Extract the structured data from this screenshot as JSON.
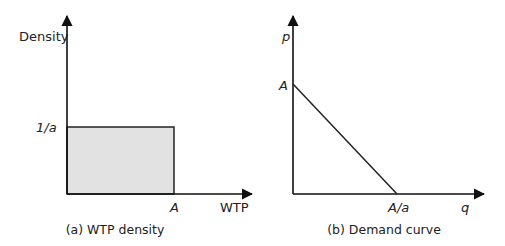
{
  "panels": [
    {
      "id": "a",
      "caption": "(a) WTP density",
      "y_axis_label": "Density",
      "x_axis_label": "WTP",
      "y_tick_label": "1/a",
      "x_tick_label": "A",
      "fill_color": "#e2e2e2"
    },
    {
      "id": "b",
      "caption": "(b) Demand curve",
      "y_axis_label": "p",
      "x_axis_label": "q",
      "y_tick_label": "A",
      "x_tick_label": "A/a"
    }
  ],
  "colors": {
    "ink": "#222222",
    "shade": "#e2e2e2"
  }
}
